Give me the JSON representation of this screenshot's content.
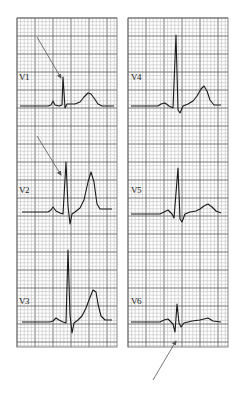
{
  "figure": {
    "type": "12-lead ECG precordial leads excerpt",
    "background": "#ffffff",
    "grid": {
      "minor_color": "#b5b5b5",
      "major_color": "#6a6a6a",
      "minor_px": 3.6,
      "major_px": 18
    },
    "trace_color": "#1a1a1a",
    "arrow_color": "#555555"
  },
  "panels": [
    {
      "name": "left-strip",
      "x": 17,
      "y": 18,
      "w": 100,
      "h": 329,
      "leads": [
        {
          "label": "V1",
          "label_x": 19,
          "label_y": 72,
          "trace": "M20,106 L48,106 L51,105 L53,101 L55,105 L59,106 L62,105 L63,77 L65,108 L67,104 L75,104 L80,102 L84,97 L88,93 L91,94 L94,98 L98,104 L102,106 L114,106"
        },
        {
          "label": "V2",
          "label_x": 19,
          "label_y": 185,
          "trace": "M22,212 L48,212 L51,210 L53,207 L56,211 L60,213 L63,214 L66,162 L68,206 L70,224 L72,214 L75,212 L80,208 L84,200 L88,182 L91,172 L94,182 L97,204 L100,209 L112,209"
        },
        {
          "label": "V3",
          "label_x": 19,
          "label_y": 296,
          "trace": "M22,322 L50,322 L53,321 L56,318 L59,320 L63,322 L66,323 L68,250 L70,315 L72,333 L74,323 L78,320 L82,316 L86,308 L89,300 L93,290 L96,292 L98,304 L101,316 L105,320 L112,320"
        }
      ]
    },
    {
      "name": "right-strip",
      "x": 128,
      "y": 18,
      "w": 100,
      "h": 329,
      "leads": [
        {
          "label": "V4",
          "label_x": 131,
          "label_y": 72,
          "trace": "M131,106 L158,106 L161,104 L165,103 L169,106 L173,108 L176,35 L178,110 L180,113 L183,106 L188,104 L193,101 L197,96 L201,89 L204,86 L207,91 L210,100 L214,105 L221,105"
        },
        {
          "label": "V5",
          "label_x": 131,
          "label_y": 185,
          "trace": "M131,214 L160,214 L164,212 L168,210 L172,214 L174,218 L178,168 L180,219 L182,222 L185,214 L190,212 L196,211 L200,209 L204,206 L208,204 L212,207 L216,211 L221,213"
        },
        {
          "label": "V6",
          "label_x": 131,
          "label_y": 296,
          "trace": "M131,322 L160,322 L164,320 L168,319 L171,322 L173,324 L175,332 L177,304 L179,323 L181,327 L184,323 L192,321 L200,320 L204,319 L208,318 L213,321 L221,322"
        }
      ]
    }
  ],
  "arrows": [
    {
      "name": "arrow-v1",
      "x1": 37,
      "y1": 37,
      "x2": 61,
      "y2": 78
    },
    {
      "name": "arrow-v2",
      "x1": 37,
      "y1": 136,
      "x2": 61,
      "y2": 175
    },
    {
      "name": "arrow-v6",
      "x1": 153,
      "y1": 380,
      "x2": 176,
      "y2": 341
    }
  ]
}
